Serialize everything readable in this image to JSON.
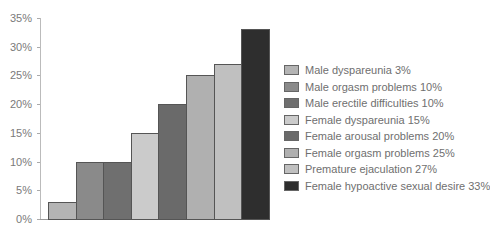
{
  "chart_data": {
    "type": "bar",
    "title": "",
    "xlabel": "",
    "ylabel": "",
    "ylim": [
      0,
      35
    ],
    "yticks": [
      "0%",
      "5%",
      "10%",
      "15%",
      "20%",
      "25%",
      "30%",
      "35%"
    ],
    "grid": false,
    "legend_position": "right",
    "categories": [
      "Male dyspareunia",
      "Male orgasm problems",
      "Male erectile difficulties",
      "Female dyspareunia",
      "Female arousal problems",
      "Female orgasm problems",
      "Premature ejaculation",
      "Female hypoactive sexual desire"
    ],
    "values": [
      3,
      10,
      10,
      15,
      20,
      25,
      27,
      33
    ],
    "colors": [
      "#b4b4b4",
      "#8a8a8a",
      "#6f6f6f",
      "#cbcbcb",
      "#6a6a6a",
      "#b0b0b0",
      "#c0c0c0",
      "#2e2e2e"
    ],
    "legend": [
      "Male dyspareunia 3%",
      "Male orgasm problems 10%",
      "Male erectile difficulties 10%",
      "Female dyspareunia 15%",
      "Female arousal problems 20%",
      "Female orgasm problems 25%",
      "Premature ejaculation 27%",
      "Female hypoactive sexual desire 33%"
    ]
  }
}
